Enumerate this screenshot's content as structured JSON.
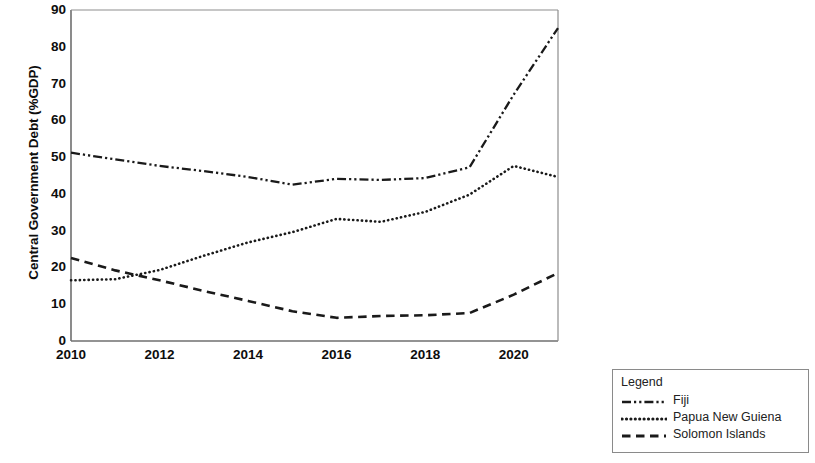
{
  "chart_data": {
    "type": "line",
    "title": "",
    "xlabel": "",
    "ylabel": "Central Government Debt (%GDP)",
    "xlim": [
      2010,
      2021
    ],
    "ylim": [
      0,
      90
    ],
    "grid": false,
    "legend_position": "bottom-right-outside",
    "legend_title": "Legend",
    "x": [
      2010,
      2011,
      2012,
      2013,
      2014,
      2015,
      2016,
      2017,
      2018,
      2019,
      2020,
      2021
    ],
    "xticks": [
      "2010",
      "2012",
      "2014",
      "2016",
      "2018",
      "2020"
    ],
    "xtick_values": [
      2010,
      2012,
      2014,
      2016,
      2018,
      2020
    ],
    "yticks": [
      "0",
      "10",
      "20",
      "30",
      "40",
      "50",
      "60",
      "70",
      "80",
      "90"
    ],
    "ytick_values": [
      0,
      10,
      20,
      30,
      40,
      50,
      60,
      70,
      80,
      90
    ],
    "series": [
      {
        "name": "Fiji",
        "linestyle": "dashdotdot",
        "color": "#1a1a1a",
        "values": [
          51.2,
          49.4,
          47.6,
          46.2,
          44.6,
          42.5,
          44.1,
          43.8,
          44.3,
          47.2,
          67.0,
          85.1
        ]
      },
      {
        "name": "Papua New Guiena",
        "linestyle": "dotted",
        "color": "#1a1a1a",
        "values": [
          16.5,
          16.8,
          19.3,
          23.2,
          26.8,
          29.6,
          33.2,
          32.4,
          35.1,
          39.8,
          47.6,
          44.6
        ]
      },
      {
        "name": "Solomon Islands",
        "linestyle": "dashed",
        "color": "#1a1a1a",
        "values": [
          22.6,
          19.2,
          16.5,
          13.6,
          10.9,
          8.1,
          6.3,
          6.8,
          7.0,
          7.6,
          12.6,
          18.5
        ]
      }
    ]
  },
  "legend": {
    "title": "Legend",
    "entries": [
      {
        "label": "Fiji",
        "style": "dashdotdot"
      },
      {
        "label": "Papua New Guiena",
        "style": "dotted"
      },
      {
        "label": "Solomon Islands",
        "style": "dashed"
      }
    ]
  }
}
